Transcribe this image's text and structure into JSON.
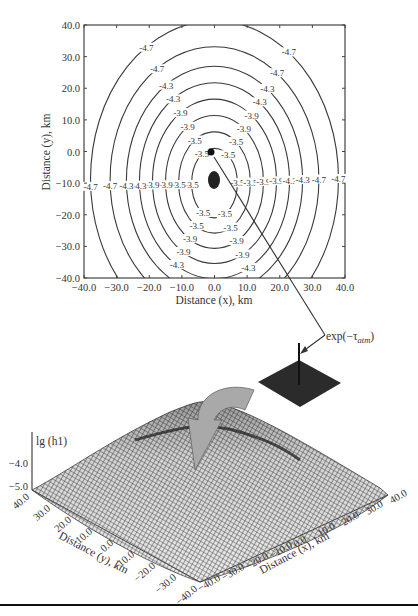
{
  "chart_data": [
    {
      "type": "contour",
      "title": "",
      "xlabel": "Distance (x), km",
      "ylabel": "Distance (y), km",
      "xlim": [
        -40,
        40
      ],
      "ylim": [
        -40,
        40
      ],
      "x_ticks": [
        "-40.0",
        "-30.0",
        "-20.0",
        "-10.0",
        "0.0",
        "10.0",
        "20.0",
        "30.0",
        "40.0"
      ],
      "y_ticks": [
        "40.0",
        "30.0",
        "20.0",
        "10.0",
        "0.0",
        "-10.0",
        "-20.0",
        "-30.0",
        "-40.0"
      ],
      "center": {
        "x": 0,
        "y": -10
      },
      "source_point": {
        "x": -1,
        "y": 1
      },
      "contour_levels": [
        {
          "label": "-3.5",
          "rx": 7,
          "ry": 11
        },
        {
          "label": "-3.5",
          "rx": 11,
          "ry": 16
        },
        {
          "label": "-3.9",
          "rx": 15,
          "ry": 21
        },
        {
          "label": "-3.9",
          "rx": 19,
          "ry": 26
        },
        {
          "label": "-4.3",
          "rx": 23,
          "ry": 31
        },
        {
          "label": "-4.3",
          "rx": 27,
          "ry": 36
        },
        {
          "label": "-4.7",
          "rx": 32,
          "ry": 42
        },
        {
          "label": "-4.7",
          "rx": 38,
          "ry": 50
        }
      ],
      "grid": false
    },
    {
      "type": "surface3d",
      "zlabel": "lg (h1)",
      "z_ticks": [
        "-4.0",
        "-5.0"
      ],
      "xlabel": "Distance (x), km",
      "ylabel": "Distance (y), km",
      "x_ticks": [
        "-40.0",
        "-30.0",
        "-20.0",
        "-10.0",
        "0.0",
        "10.0",
        "20.0",
        "30.0",
        "40.0"
      ],
      "y_ticks": [
        "40.0",
        "30.0",
        "20.0",
        "10.0",
        "0.0",
        "-10.0",
        "-20.0",
        "-30.0",
        "-40.0"
      ],
      "zlim": [
        -5.0,
        -3.5
      ]
    }
  ],
  "annotations": {
    "kernel_label_main": "exp(−τ",
    "kernel_label_sub": "atm",
    "kernel_label_end": ")"
  },
  "colors": {
    "line": "#3a3a3a",
    "kernel_fill": "#2b2b2b",
    "arrow_fill": "#a9a9a9",
    "mesh": "#555555"
  }
}
